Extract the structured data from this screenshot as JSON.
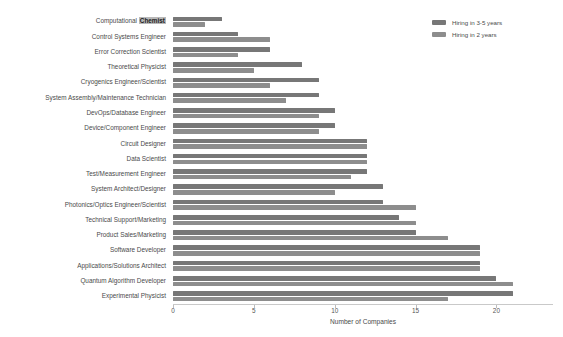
{
  "chart_data": {
    "type": "bar",
    "orientation": "horizontal",
    "title": "",
    "xlabel": "Number of Companies",
    "ylabel": "",
    "xlim": [
      0,
      23.5
    ],
    "xticks": [
      0,
      5,
      10,
      15,
      20
    ],
    "xtick_labels": [
      "0",
      "5",
      "10",
      "15",
      "20"
    ],
    "grid": false,
    "legend_position": "top-right",
    "categories": [
      "Computational Chemist",
      "Control Systems Engineer",
      "Error Correction Scientist",
      "Theoretical Physicist",
      "Cryogenics Engineer/Scientist",
      "System Assembly/Maintenance Technician",
      "DevOps/Database Engineer",
      "Device/Component Engineer",
      "Circuit Designer",
      "Data Scientist",
      "Test/Measurement Engineer",
      "System Architect/Designer",
      "Photonics/Optics Engineer/Scientist",
      "Technical Support/Marketing",
      "Product Sales/Marketing",
      "Software Developer",
      "Applications/Solutions Architect",
      "Quantum Algorithm Developer",
      "Experimental Physicist"
    ],
    "highlighted_category": "Computational Chemist",
    "highlighted_text": "Chemist",
    "series": [
      {
        "name": "Hiring in 3-5 years",
        "color": "#777777",
        "values": [
          3,
          4,
          6,
          8,
          9,
          9,
          10,
          10,
          12,
          12,
          12,
          13,
          13,
          14,
          15,
          19,
          19,
          20,
          21
        ]
      },
      {
        "name": "Hiring in 2 years",
        "color": "#8d8d8d",
        "values": [
          2,
          6,
          4,
          5,
          6,
          7,
          9,
          9,
          12,
          12,
          11,
          10,
          15,
          15,
          17,
          19,
          19,
          21,
          17
        ]
      }
    ]
  },
  "legend": {
    "entries": [
      {
        "label": "Hiring in 3-5 years",
        "color": "#777777"
      },
      {
        "label": "Hiring in 2 years",
        "color": "#8d8d8d"
      }
    ]
  },
  "axis": {
    "x_title": "Number of Companies"
  }
}
